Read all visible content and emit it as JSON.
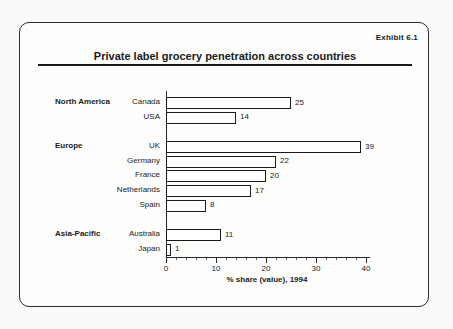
{
  "page": {
    "exhibit_label": "Exhibit 6.1",
    "title": "Private label grocery penetration across countries"
  },
  "chart_data": {
    "type": "bar",
    "orientation": "horizontal",
    "title": "Private label grocery penetration across countries",
    "xlabel": "% share (value), 1994",
    "xlim": [
      0,
      40
    ],
    "xticks": [
      0,
      10,
      20,
      30,
      40
    ],
    "minor_tick_step": 2,
    "bar_fill": "#ffffff",
    "bar_border": "#1a1a1a",
    "groups": [
      {
        "name": "North America",
        "rows": [
          {
            "label": "Canada",
            "value": 25
          },
          {
            "label": "USA",
            "value": 14
          }
        ]
      },
      {
        "name": "Europe",
        "rows": [
          {
            "label": "UK",
            "value": 39
          },
          {
            "label": "Germany",
            "value": 22
          },
          {
            "label": "France",
            "value": 20
          },
          {
            "label": "Netherlands",
            "value": 17
          },
          {
            "label": "Spain",
            "value": 8
          }
        ]
      },
      {
        "name": "Asia-Pacific",
        "rows": [
          {
            "label": "Australia",
            "value": 11
          },
          {
            "label": "Japan",
            "value": 1
          }
        ]
      }
    ]
  }
}
